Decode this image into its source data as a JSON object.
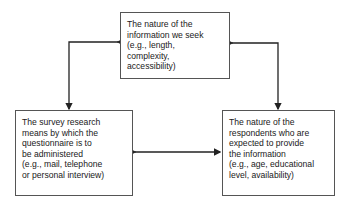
{
  "diagram": {
    "nodes": [
      {
        "id": "information",
        "lines": [
          "The nature of the",
          "information we seek",
          "(e.g., length,",
          "complexity,",
          "accessibility)"
        ]
      },
      {
        "id": "means",
        "lines": [
          "The survey research",
          "means by which the",
          "questionnaire is to",
          "be administered",
          "(e.g., mail, telephone",
          "or personal interview)"
        ]
      },
      {
        "id": "respondents",
        "lines": [
          "The nature of the",
          "respondents who are",
          "expected to provide",
          "the information",
          "(e.g., age, educational",
          "level, availability)"
        ]
      }
    ],
    "edges": [
      {
        "from": "means",
        "to": "information",
        "type": "bidirectional"
      },
      {
        "from": "information",
        "to": "respondents",
        "type": "bidirectional"
      },
      {
        "from": "means",
        "to": "respondents",
        "type": "bidirectional"
      }
    ]
  }
}
